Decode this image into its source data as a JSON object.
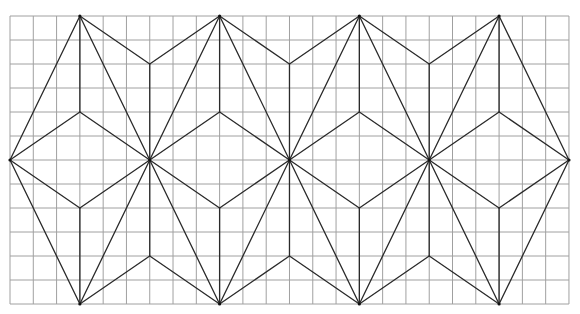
{
  "figure": {
    "grid": {
      "columns": 24,
      "rows": 12,
      "origin_x": 10,
      "origin_y": 16,
      "cell_width": 23.29,
      "cell_height": 24,
      "line_color": "#a0a0a0"
    },
    "pattern": {
      "line_color": "#2a2a2a",
      "unit_width_cols": 6,
      "unit_count": 4,
      "segments_in_grid_coords": [
        [
          0,
          6,
          3,
          0
        ],
        [
          0,
          6,
          3,
          12
        ],
        [
          0,
          6,
          3,
          4
        ],
        [
          0,
          6,
          3,
          8
        ],
        [
          3,
          4,
          6,
          6
        ],
        [
          3,
          8,
          6,
          6
        ],
        [
          3,
          0,
          3,
          4
        ],
        [
          3,
          8,
          3,
          12
        ],
        [
          3,
          0,
          6,
          6
        ],
        [
          3,
          12,
          6,
          6
        ],
        [
          3,
          0,
          6,
          2
        ],
        [
          3,
          12,
          6,
          10
        ],
        [
          6,
          2,
          6,
          10
        ],
        [
          6,
          2,
          9,
          0
        ],
        [
          6,
          10,
          9,
          12
        ],
        [
          6,
          6,
          9,
          0
        ],
        [
          6,
          6,
          9,
          12
        ],
        [
          6,
          6,
          9,
          4
        ],
        [
          6,
          6,
          9,
          8
        ],
        [
          9,
          4,
          12,
          6
        ],
        [
          9,
          8,
          12,
          6
        ],
        [
          9,
          0,
          9,
          4
        ],
        [
          9,
          8,
          9,
          12
        ],
        [
          9,
          0,
          12,
          6
        ],
        [
          9,
          12,
          12,
          6
        ],
        [
          9,
          0,
          12,
          2
        ],
        [
          9,
          12,
          12,
          10
        ],
        [
          12,
          2,
          12,
          10
        ],
        [
          12,
          2,
          15,
          0
        ],
        [
          12,
          10,
          15,
          12
        ],
        [
          12,
          6,
          15,
          0
        ],
        [
          12,
          6,
          15,
          12
        ],
        [
          12,
          6,
          15,
          4
        ],
        [
          12,
          6,
          15,
          8
        ],
        [
          15,
          4,
          18,
          6
        ],
        [
          15,
          8,
          18,
          6
        ],
        [
          15,
          0,
          15,
          4
        ],
        [
          15,
          8,
          15,
          12
        ],
        [
          15,
          0,
          18,
          6
        ],
        [
          15,
          12,
          18,
          6
        ],
        [
          15,
          0,
          18,
          2
        ],
        [
          15,
          12,
          18,
          10
        ],
        [
          18,
          2,
          18,
          10
        ],
        [
          18,
          2,
          21,
          0
        ],
        [
          18,
          10,
          21,
          12
        ],
        [
          18,
          6,
          21,
          0
        ],
        [
          18,
          6,
          21,
          12
        ],
        [
          18,
          6,
          21,
          4
        ],
        [
          18,
          6,
          21,
          8
        ],
        [
          21,
          4,
          24,
          6
        ],
        [
          21,
          8,
          24,
          6
        ],
        [
          21,
          0,
          21,
          4
        ],
        [
          21,
          8,
          21,
          12
        ],
        [
          21,
          0,
          24,
          6
        ],
        [
          21,
          12,
          24,
          6
        ]
      ],
      "vertices_in_grid_coords": [
        [
          0,
          6
        ],
        [
          6,
          6
        ],
        [
          12,
          6
        ],
        [
          18,
          6
        ],
        [
          24,
          6
        ],
        [
          3,
          0
        ],
        [
          9,
          0
        ],
        [
          15,
          0
        ],
        [
          21,
          0
        ],
        [
          3,
          12
        ],
        [
          9,
          12
        ],
        [
          15,
          12
        ],
        [
          21,
          12
        ]
      ]
    }
  }
}
